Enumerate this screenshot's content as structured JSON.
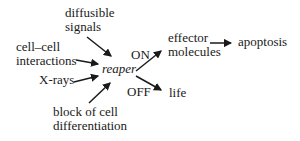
{
  "diagram": {
    "title_implied": "reaper gene regulation of apoptosis",
    "colors": {
      "background": "#ffffff",
      "text": "#1a1a1a",
      "arrow": "#1a1a1a"
    },
    "nodes": {
      "diffusible_signals": {
        "line1": "diffusible",
        "line2": "signals"
      },
      "cell_cell_interactions": {
        "line1": "cell–cell",
        "line2": "interactions"
      },
      "x_rays": {
        "label": "X-rays"
      },
      "block_differentiation": {
        "line1": "block of cell",
        "line2": "differentiation"
      },
      "reaper": {
        "label": "reaper",
        "style": "italic"
      },
      "on_state": {
        "label": "ON"
      },
      "off_state": {
        "label": "OFF"
      },
      "effector_molecules": {
        "line1": "effector",
        "line2": "molecules"
      },
      "apoptosis": {
        "label": "apoptosis"
      },
      "life": {
        "label": "life"
      }
    },
    "edges": [
      {
        "from": "diffusible signals",
        "to": "reaper"
      },
      {
        "from": "cell–cell interactions",
        "to": "reaper"
      },
      {
        "from": "X-rays",
        "to": "reaper"
      },
      {
        "from": "block of cell differentiation",
        "to": "reaper"
      },
      {
        "from": "reaper",
        "to": "effector molecules",
        "via": "ON"
      },
      {
        "from": "reaper",
        "to": "life",
        "via": "OFF"
      },
      {
        "from": "effector molecules",
        "to": "apoptosis"
      }
    ]
  }
}
